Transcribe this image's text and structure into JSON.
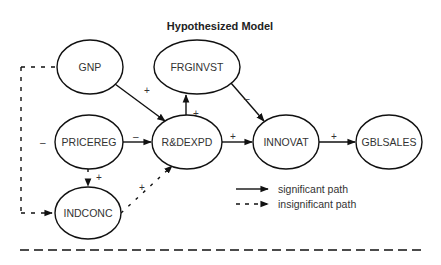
{
  "title": "Hypothesized Model",
  "nodes": {
    "gnp": "GNP",
    "frginvst": "FRGINVST",
    "pricereg": "PRICEREG",
    "rdexpd": "R&DEXPD",
    "innovat": "INNOVAT",
    "gblsales": "GBLSALES",
    "indconc": "INDCONC"
  },
  "edges": [
    {
      "from": "GNP",
      "to": "R&DEXPD",
      "sign": "+",
      "type": "significant"
    },
    {
      "from": "R&DEXPD",
      "to": "FRGINVST",
      "sign": "+",
      "type": "significant"
    },
    {
      "from": "FRGINVST",
      "to": "INNOVAT",
      "sign": "–",
      "type": "significant"
    },
    {
      "from": "PRICEREG",
      "to": "R&DEXPD",
      "sign": "–",
      "type": "significant"
    },
    {
      "from": "R&DEXPD",
      "to": "INNOVAT",
      "sign": "+",
      "type": "significant"
    },
    {
      "from": "INNOVAT",
      "to": "GBLSALES",
      "sign": "+",
      "type": "significant"
    },
    {
      "from": "PRICEREG",
      "to": "INDCONC",
      "sign": "+",
      "type": "insignificant"
    },
    {
      "from": "INDCONC",
      "to": "R&DEXPD",
      "sign": "+",
      "type": "insignificant"
    },
    {
      "from": "GNP",
      "to": "INDCONC",
      "sign": "–",
      "type": "insignificant"
    }
  ],
  "signs": {
    "gnp_rd": "+",
    "rd_frg": "+",
    "frg_inn": "–",
    "price_rd": "–",
    "rd_inn": "+",
    "inn_gbl": "+",
    "price_ind": "+",
    "ind_rd": "+",
    "left_gnp": "–",
    "left_price": "–",
    "left_ind": "–"
  },
  "legend": {
    "significant": "significant path",
    "insignificant": "insignificant path"
  }
}
